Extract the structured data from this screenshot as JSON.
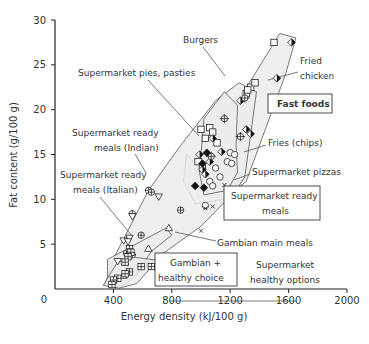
{
  "chart_data": {
    "type": "scatter",
    "title": "",
    "xlabel": "Energy density (kJ/100 g)",
    "ylabel": "Fat content (g/100 g)",
    "xlim": [
      0,
      2000
    ],
    "ylim": [
      0,
      30
    ],
    "xticks": [
      0,
      400,
      800,
      1200,
      1600,
      2000
    ],
    "yticks": [
      0,
      5,
      10,
      15,
      20,
      25,
      30
    ],
    "grid": false,
    "legend": "none (direct annotations)",
    "region_fill": "#ececec",
    "regions": [
      {
        "name": "Fast foods",
        "polygon": [
          [
            1020,
            13
          ],
          [
            1180,
            19
          ],
          [
            1540,
            28.5
          ],
          [
            1650,
            28
          ],
          [
            1580,
            24
          ],
          [
            1310,
            12
          ],
          [
            1160,
            10
          ],
          [
            960,
            9.5
          ],
          [
            880,
            12
          ],
          [
            900,
            15
          ]
        ]
      },
      {
        "name": "Supermarket ready meals",
        "polygon": [
          [
            340,
            0.5
          ],
          [
            420,
            4
          ],
          [
            640,
            11
          ],
          [
            860,
            16
          ],
          [
            1100,
            21
          ],
          [
            1260,
            23
          ],
          [
            1380,
            22
          ],
          [
            1300,
            12.5
          ],
          [
            1240,
            11
          ],
          [
            1000,
            7
          ],
          [
            700,
            3.5
          ],
          [
            460,
            0.3
          ]
        ]
      },
      {
        "name": "Fries / pizzas inner group",
        "polygon": [
          [
            1020,
            19
          ],
          [
            1160,
            22
          ],
          [
            1250,
            20.5
          ],
          [
            1240,
            16
          ],
          [
            1250,
            13
          ],
          [
            1180,
            11
          ],
          [
            1020,
            10.5
          ],
          [
            990,
            13
          ]
        ]
      },
      {
        "name": "Gambian + healthy choice",
        "polygon": [
          [
            360,
            3.3
          ],
          [
            760,
            6.8
          ],
          [
            800,
            6
          ],
          [
            660,
            4.2
          ],
          [
            540,
            1.2
          ],
          [
            450,
            0.3
          ],
          [
            360,
            1.5
          ]
        ]
      },
      {
        "name": "Supermarket healthy options",
        "polygon": [
          [
            330,
            0.4
          ],
          [
            420,
            2.8
          ],
          [
            520,
            3.6
          ],
          [
            700,
            3.2
          ],
          [
            560,
            0.6
          ],
          [
            440,
            0.1
          ]
        ]
      }
    ],
    "series": [
      {
        "name": "Burgers",
        "marker": "square-open",
        "points": [
          [
            1500,
            27.5
          ],
          [
            1340,
            22.5
          ],
          [
            1370,
            23
          ],
          [
            1310,
            21.8
          ],
          [
            1320,
            22.2
          ],
          [
            1060,
            18
          ],
          [
            1080,
            17.5
          ],
          [
            1000,
            17.8
          ],
          [
            1030,
            16.8
          ],
          [
            1110,
            16.3
          ],
          [
            980,
            14.2
          ],
          [
            1010,
            13.5
          ]
        ]
      },
      {
        "name": "Fried chicken",
        "marker": "diamond-half",
        "points": [
          [
            1620,
            27.5
          ],
          [
            1520,
            23.5
          ],
          [
            1270,
            21
          ],
          [
            1310,
            17.8
          ],
          [
            1340,
            17.3
          ],
          [
            1080,
            16.8
          ],
          [
            1140,
            15.3
          ],
          [
            1060,
            14.2
          ],
          [
            990,
            15
          ],
          [
            1010,
            13.3
          ],
          [
            1030,
            12.8
          ]
        ]
      },
      {
        "name": "Supermarket pies, pasties",
        "marker": "circle-plus-cross",
        "points": [
          [
            1300,
            21.3
          ],
          [
            1160,
            19
          ],
          [
            1270,
            17
          ],
          [
            1070,
            14.8
          ]
        ]
      },
      {
        "name": "Fast foods (solid)",
        "marker": "diamond-filled",
        "points": [
          [
            1040,
            15.2
          ],
          [
            1010,
            14
          ],
          [
            1020,
            11.3
          ],
          [
            960,
            11.5
          ]
        ]
      },
      {
        "name": "Fries (chips)",
        "marker": "circle-open",
        "points": [
          [
            1200,
            15.2
          ],
          [
            1230,
            15
          ],
          [
            1180,
            14.2
          ],
          [
            1210,
            14
          ],
          [
            1100,
            13.5
          ],
          [
            1130,
            12.5
          ],
          [
            1060,
            12
          ],
          [
            1080,
            11.5
          ],
          [
            1030,
            9.3
          ]
        ]
      },
      {
        "name": "Supermarket pizzas",
        "marker": "x",
        "points": [
          [
            1160,
            11.6
          ],
          [
            1000,
            6.5
          ],
          [
            1030,
            9
          ],
          [
            1080,
            9.2
          ]
        ]
      },
      {
        "name": "Supermarket ready meals (Indian)",
        "marker": "circle-plus",
        "points": [
          [
            640,
            11
          ],
          [
            660,
            10.8
          ],
          [
            530,
            8.4
          ],
          [
            860,
            8.8
          ],
          [
            590,
            6
          ],
          [
            490,
            4
          ],
          [
            530,
            3.8
          ]
        ]
      },
      {
        "name": "Supermarket ready meals (Italian)",
        "marker": "triangle-down",
        "points": [
          [
            710,
            10.3
          ],
          [
            530,
            8.1
          ],
          [
            470,
            5.4
          ],
          [
            510,
            5.7
          ],
          [
            430,
            3.1
          ],
          [
            500,
            5.3
          ]
        ]
      },
      {
        "name": "Gambian main meals",
        "marker": "triangle-up",
        "points": [
          [
            780,
            6.8
          ],
          [
            640,
            4.5
          ],
          [
            480,
            3
          ],
          [
            470,
            1.5
          ]
        ]
      },
      {
        "name": "Supermarket healthy options",
        "marker": "square-plus",
        "points": [
          [
            510,
            4.5
          ],
          [
            520,
            4.1
          ],
          [
            500,
            3.6
          ],
          [
            480,
            3
          ],
          [
            590,
            2.5
          ],
          [
            660,
            2.5
          ],
          [
            510,
            1.9
          ],
          [
            480,
            1.7
          ],
          [
            430,
            1.2
          ],
          [
            400,
            1
          ],
          [
            390,
            0.5
          ]
        ]
      }
    ],
    "annotations": [
      {
        "text": "Burgers",
        "x_px": 183,
        "y_px": 43,
        "boxed": false
      },
      {
        "text": "Fried",
        "x_px": 300,
        "y_px": 64,
        "boxed": false
      },
      {
        "text": "chicken",
        "x_px": 300,
        "y_px": 79,
        "boxed": false
      },
      {
        "text": "Supermarket pies, pasties",
        "x_px": 78,
        "y_px": 76,
        "boxed": false
      },
      {
        "text": "Fast foods",
        "x_px": 277,
        "y_px": 107,
        "boxed": true
      },
      {
        "text": "Supermarket ready",
        "x_px": 72,
        "y_px": 136,
        "boxed": false
      },
      {
        "text": "meals (Indian)",
        "x_px": 94,
        "y_px": 151,
        "boxed": false
      },
      {
        "text": "Fries (chips)",
        "x_px": 268,
        "y_px": 146,
        "boxed": false
      },
      {
        "text": "Supermarket ready",
        "x_px": 60,
        "y_px": 178,
        "boxed": false
      },
      {
        "text": "meals (Italian)",
        "x_px": 73,
        "y_px": 193,
        "boxed": false
      },
      {
        "text": "Supermarket pizzas",
        "x_px": 252,
        "y_px": 175,
        "boxed": false
      },
      {
        "text": "Supermarket ready",
        "x_px": 231,
        "y_px": 199,
        "boxed": true
      },
      {
        "text": "meals",
        "x_px": 262,
        "y_px": 214,
        "boxed": true
      },
      {
        "text": "Gambian main meals",
        "x_px": 217,
        "y_px": 246,
        "boxed": false
      },
      {
        "text": "Gambian +",
        "x_px": 170,
        "y_px": 266,
        "boxed": true
      },
      {
        "text": "healthy choice",
        "x_px": 158,
        "y_px": 281,
        "boxed": true
      },
      {
        "text": "Supermarket",
        "x_px": 256,
        "y_px": 268,
        "boxed": false
      },
      {
        "text": "healthy options",
        "x_px": 250,
        "y_px": 283,
        "boxed": false
      }
    ]
  },
  "axes": {
    "xlabel": "Energy density (kJ/100 g)",
    "ylabel": "Fat content (g/100 g)",
    "xtick_labels": [
      "0",
      "400",
      "800",
      "1200",
      "1600",
      "2000"
    ],
    "ytick_labels": [
      "5",
      "10",
      "15",
      "20",
      "25",
      "30"
    ]
  },
  "labels": {
    "burgers": "Burgers",
    "fried": "Fried",
    "chicken": "chicken",
    "pies": "Supermarket pies, pasties",
    "fast_foods": "Fast foods",
    "indian_1": "Supermarket ready",
    "indian_2": "meals (Indian)",
    "fries": "Fries (chips)",
    "italian_1": "Supermarket ready",
    "italian_2": "meals (Italian)",
    "pizzas": "Supermarket pizzas",
    "ready_1": "Supermarket ready",
    "ready_2": "meals",
    "gambian_main": "Gambian main meals",
    "gambian_1": "Gambian +",
    "gambian_2": "healthy choice",
    "healthy_1": "Supermarket",
    "healthy_2": "healthy options"
  }
}
